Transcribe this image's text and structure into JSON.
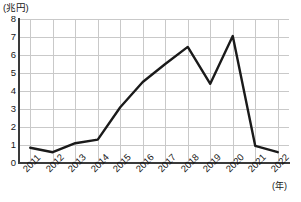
{
  "chart_data": {
    "type": "line",
    "title": "",
    "subtitle": "",
    "xlabel": "(年)",
    "ylabel": "(兆円)",
    "categories": [
      "2011",
      "2012",
      "2013",
      "2014",
      "2015",
      "2016",
      "2017",
      "2018",
      "2019",
      "2020",
      "2021",
      "2022"
    ],
    "series": [
      {
        "name": "金額",
        "values": [
          0.85,
          0.6,
          1.1,
          1.3,
          3.1,
          4.5,
          5.5,
          6.45,
          4.4,
          7.05,
          0.95,
          0.6
        ]
      }
    ],
    "ylim": [
      0,
      8
    ],
    "y_ticks": [
      "0",
      "1",
      "2",
      "3",
      "4",
      "5",
      "6",
      "7",
      "8"
    ],
    "grid": true,
    "legend": "none",
    "line_color": "#1a1a1a",
    "grid_color": "#c9c9c9",
    "axis_color": "#3a3a3a"
  }
}
